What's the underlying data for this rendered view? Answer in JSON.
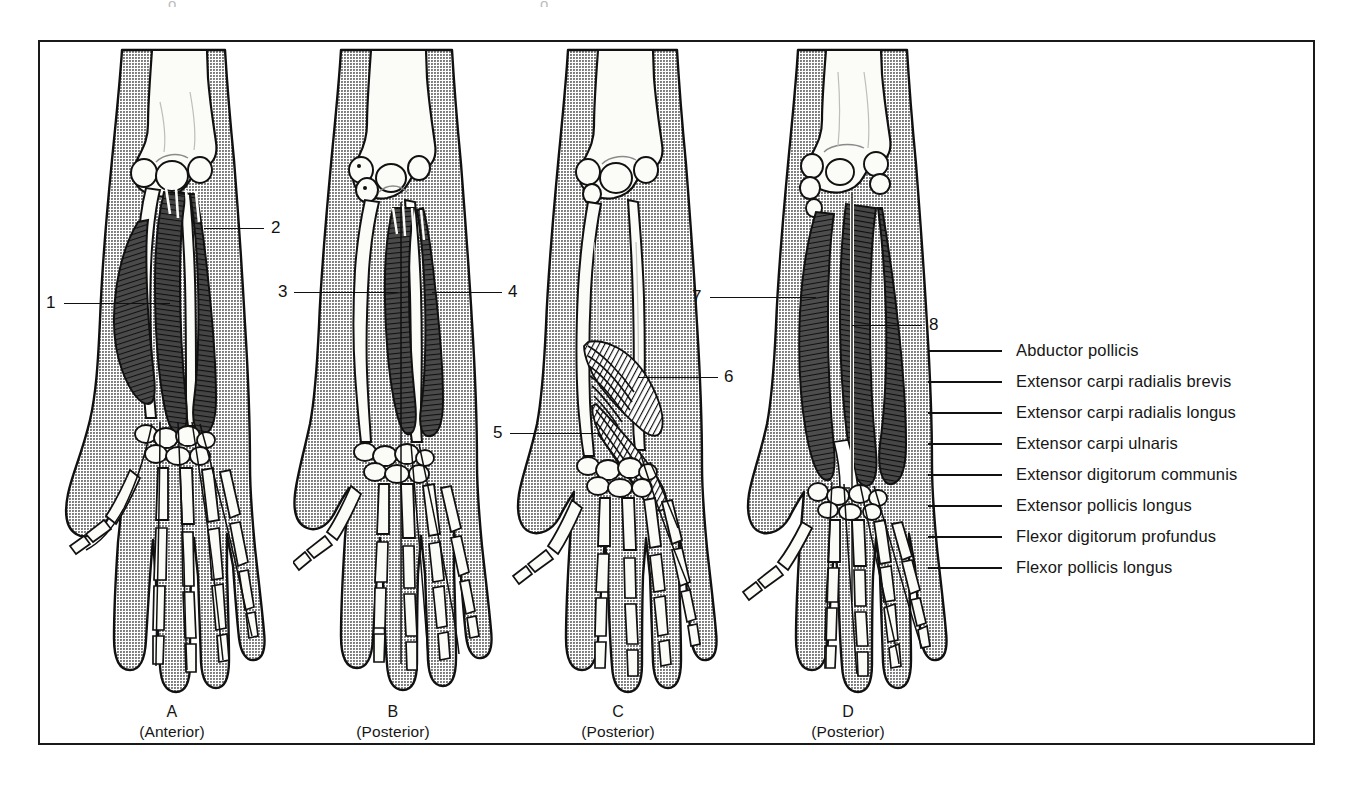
{
  "figure": {
    "type": "anatomical-illustration",
    "panels": [
      {
        "id": "A",
        "letter": "A",
        "view": "(Anterior)",
        "callouts": [
          "1",
          "2"
        ]
      },
      {
        "id": "B",
        "letter": "B",
        "view": "(Posterior)",
        "callouts": [
          "3",
          "4"
        ]
      },
      {
        "id": "C",
        "letter": "C",
        "view": "(Posterior)",
        "callouts": [
          "5",
          "6"
        ]
      },
      {
        "id": "D",
        "letter": "D",
        "view": "(Posterior)",
        "callouts": [
          "7",
          "8"
        ]
      }
    ]
  },
  "callouts": {
    "n1": "1",
    "n2": "2",
    "n3": "3",
    "n4": "4",
    "n5": "5",
    "n6": "6",
    "n7": "7",
    "n8": "8"
  },
  "legend": {
    "items": [
      {
        "label": "Abductor pollicis"
      },
      {
        "label": "Extensor carpi radialis brevis"
      },
      {
        "label": "Extensor carpi radialis longus"
      },
      {
        "label": "Extensor carpi ulnaris"
      },
      {
        "label": "Extensor digitorum communis"
      },
      {
        "label": "Extensor pollicis longus"
      },
      {
        "label": "Flexor digitorum profundus"
      },
      {
        "label": "Flexor pollicis longus"
      }
    ]
  },
  "colors": {
    "frame": "#1a1a1a",
    "skin_gray": "#a9a9a9",
    "bone_white": "#fbfbf7",
    "muscle_dark": "#3b3b3b",
    "outline": "#111111",
    "text": "#161616"
  }
}
